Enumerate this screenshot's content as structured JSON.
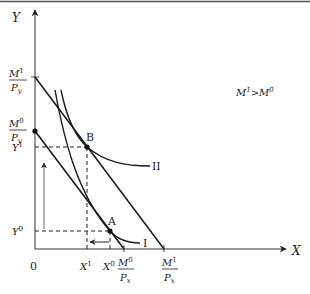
{
  "diagram": {
    "type": "consumer-choice-income-effect",
    "axes": {
      "x_label": "X",
      "y_label": "Y",
      "origin_label": "0"
    },
    "annotation": {
      "base": "M",
      "sup1": "1",
      "op": ">",
      "sup0": "0"
    },
    "y_intercepts": [
      {
        "num": "M",
        "num_sup": "1",
        "den": "P",
        "den_sub": "y"
      },
      {
        "num": "M",
        "num_sup": "0",
        "den": "P",
        "den_sub": "y"
      }
    ],
    "x_intercepts": [
      {
        "num": "M",
        "num_sup": "0",
        "den": "P",
        "den_sub": "x"
      },
      {
        "num": "M",
        "num_sup": "1",
        "den": "P",
        "den_sub": "x"
      }
    ],
    "y_ticks": [
      {
        "base": "Y",
        "sup": "1"
      },
      {
        "base": "Y",
        "sup": "0"
      }
    ],
    "x_ticks": [
      {
        "base": "X",
        "sup": "1"
      },
      {
        "base": "X",
        "sup": "0"
      }
    ],
    "points": [
      {
        "label": "B"
      },
      {
        "label": "A"
      }
    ],
    "curves": [
      {
        "label": "II"
      },
      {
        "label": "I"
      }
    ],
    "colors": {
      "line": "#1a1a1a",
      "axis": "#333333",
      "arrow_gray": "#666666",
      "top_rule": "#555555"
    }
  }
}
